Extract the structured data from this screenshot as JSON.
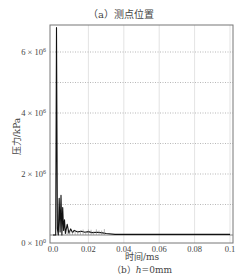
{
  "captions": {
    "top": "（a）测点位置",
    "bottom_prefix": "（b）",
    "bottom_var": "h",
    "bottom_rest": "=0mm"
  },
  "chart_data": {
    "type": "line",
    "title": "",
    "xlabel": "时间/ms",
    "ylabel": "压力/kPa",
    "xlim": [
      0.0,
      0.1
    ],
    "ylim": [
      0,
      7000000
    ],
    "xticks": [
      "0.0",
      "0.02",
      "0.04",
      "0.06",
      "0.08",
      "0.1"
    ],
    "yticks": [
      "0 × 10⁰",
      "2 × 10⁶",
      "4 × 10⁶",
      "6 × 10⁶"
    ],
    "grid": {
      "horizontal": "dotted",
      "vertical": "solid-light"
    },
    "legend": null,
    "series": [
      {
        "name": "pressure",
        "color": "#111111",
        "x": [
          0.0,
          0.0015,
          0.002,
          0.0025,
          0.003,
          0.0035,
          0.004,
          0.0045,
          0.005,
          0.0055,
          0.006,
          0.0065,
          0.007,
          0.008,
          0.009,
          0.01,
          0.011,
          0.012,
          0.014,
          0.016,
          0.018,
          0.02,
          0.022,
          0.025,
          0.028,
          0.03,
          0.035,
          0.1
        ],
        "y": [
          0,
          0,
          6800000,
          200000,
          0,
          1200000,
          100000,
          1300000,
          0,
          900000,
          150000,
          500000,
          50000,
          350000,
          60000,
          200000,
          80000,
          150000,
          100000,
          120000,
          90000,
          110000,
          80000,
          90000,
          70000,
          50000,
          20000,
          20000
        ]
      }
    ]
  }
}
